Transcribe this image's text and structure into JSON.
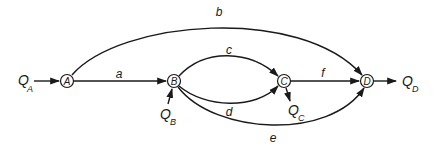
{
  "diagram": {
    "type": "flow-network",
    "nodes": [
      {
        "id": "A",
        "label": "A",
        "x": 67,
        "y": 81
      },
      {
        "id": "B",
        "label": "B",
        "x": 174,
        "y": 81
      },
      {
        "id": "C",
        "label": "C",
        "x": 284,
        "y": 81
      },
      {
        "id": "D",
        "label": "D",
        "x": 367,
        "y": 81
      }
    ],
    "edges": [
      {
        "id": "a",
        "label": "a",
        "from": "A",
        "to": "B"
      },
      {
        "id": "b",
        "label": "b",
        "from": "A",
        "to": "D"
      },
      {
        "id": "c",
        "label": "c",
        "from": "B",
        "to": "C"
      },
      {
        "id": "d",
        "label": "d",
        "from": "B",
        "to": "C"
      },
      {
        "id": "e",
        "label": "e",
        "from": "B",
        "to": "D"
      },
      {
        "id": "f",
        "label": "f",
        "from": "C",
        "to": "D"
      }
    ],
    "flows": {
      "qa": {
        "main": "Q",
        "sub": "A",
        "direction": "in",
        "node": "A"
      },
      "qb": {
        "main": "Q",
        "sub": "B",
        "direction": "in",
        "node": "B"
      },
      "qc": {
        "main": "Q",
        "sub": "C",
        "direction": "out",
        "node": "C"
      },
      "qd": {
        "main": "Q",
        "sub": "D",
        "direction": "out",
        "node": "D"
      }
    },
    "colors": {
      "stroke": "#1a1a1a",
      "background": "#ffffff"
    }
  }
}
